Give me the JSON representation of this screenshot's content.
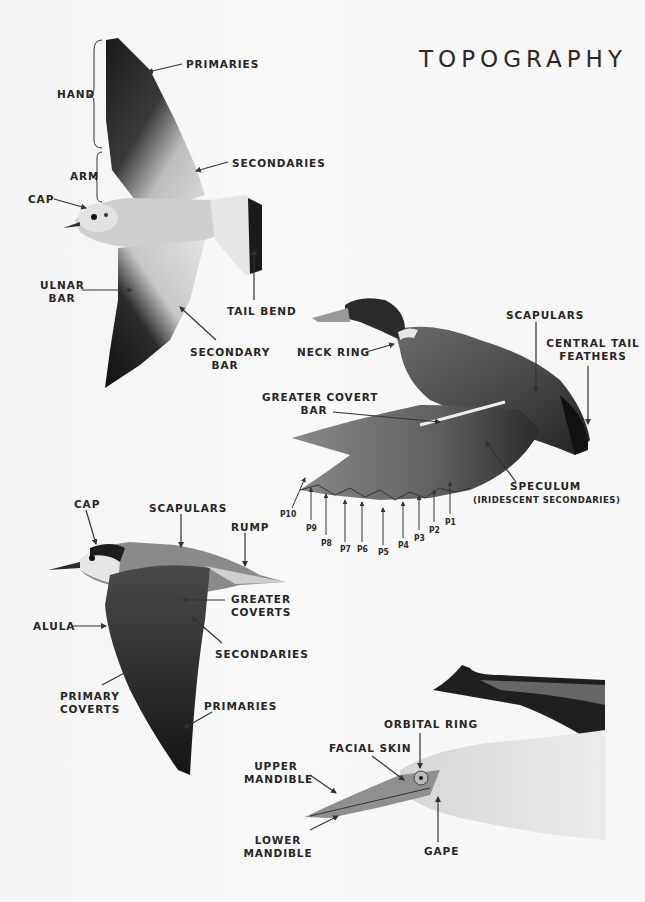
{
  "page": {
    "title": "TOPOGRAPHY",
    "background": "#f7f7f7",
    "text_color": "#262626"
  },
  "gull": {
    "labels": {
      "hand": "HAND",
      "arm": "ARM",
      "primaries": "PRIMARIES",
      "secondaries": "SECONDARIES",
      "cap": "CAP",
      "ulnar_bar_1": "ULNAR",
      "ulnar_bar_2": "BAR",
      "tail_bend": "TAIL BEND",
      "secondary_bar_1": "SECONDARY",
      "secondary_bar_2": "BAR"
    }
  },
  "mallard": {
    "labels": {
      "neck_ring": "NECK RING",
      "scapulars": "SCAPULARS",
      "central_tail_1": "CENTRAL TAIL",
      "central_tail_2": "FEATHERS",
      "greater_covert_1": "GREATER COVERT",
      "greater_covert_2": "BAR",
      "speculum": "SPECULUM",
      "speculum_note": "(IRIDESCENT SECONDARIES)"
    },
    "primaries": [
      "P10",
      "P9",
      "P8",
      "P7",
      "P6",
      "P5",
      "P4",
      "P3",
      "P2",
      "P1"
    ]
  },
  "tern": {
    "labels": {
      "cap": "CAP",
      "scapulars": "SCAPULARS",
      "rump": "RUMP",
      "greater_coverts_1": "GREATER",
      "greater_coverts_2": "COVERTS",
      "alula": "ALULA",
      "secondaries": "SECONDARIES",
      "primary_coverts_1": "PRIMARY",
      "primary_coverts_2": "COVERTS",
      "primaries": "PRIMARIES"
    }
  },
  "gannet": {
    "labels": {
      "orbital_ring": "ORBITAL RING",
      "facial_skin": "FACIAL SKIN",
      "upper_mandible_1": "UPPER",
      "upper_mandible_2": "MANDIBLE",
      "lower_mandible_1": "LOWER",
      "lower_mandible_2": "MANDIBLE",
      "gape": "GAPE"
    }
  }
}
